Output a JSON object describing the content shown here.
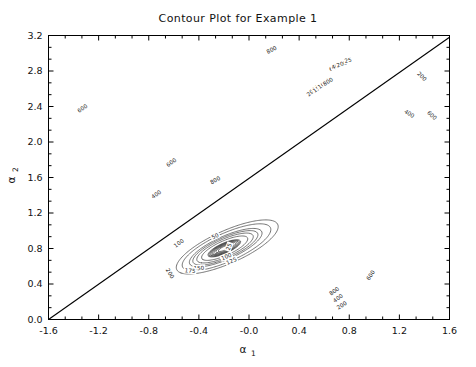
{
  "figure": {
    "title": "Contour Plot for Example 1",
    "background_color": "#ffffff",
    "line_color": "#3a3a3a",
    "axis_color": "#000000"
  },
  "axes": {
    "x": {
      "label_base": "α",
      "label_sub": "1",
      "min": -1.6,
      "max": 1.6,
      "tick_step": 0.4,
      "ticks": [
        -1.6,
        -1.2,
        -0.8,
        -0.4,
        -0.0,
        0.4,
        0.8,
        1.2,
        1.6
      ],
      "tick_labels": [
        "-1.6",
        "-1.2",
        "-0.8",
        "-0.4",
        "-0.0",
        "0.4",
        "0.8",
        "1.2",
        "1.6"
      ],
      "minor_per_major": 2
    },
    "y": {
      "label_base": "α",
      "label_sub": "2",
      "min": 0.0,
      "max": 3.2,
      "tick_step": 0.4,
      "ticks": [
        0.0,
        0.4,
        0.8,
        1.2,
        1.6,
        2.0,
        2.4,
        2.8,
        3.2
      ],
      "tick_labels": [
        "0.0",
        "0.4",
        "0.8",
        "1.2",
        "1.6",
        "2.0",
        "2.4",
        "2.8",
        "3.2"
      ],
      "minor_per_major": 2
    }
  },
  "chart_data": {
    "type": "contour",
    "title": "Contour Plot for Example 1",
    "xlabel": "α₁",
    "ylabel": "α₂",
    "xlim": [
      -1.6,
      1.6
    ],
    "ylim": [
      0.0,
      3.2
    ],
    "grid": false,
    "legend": "none",
    "levels": [
      25,
      50,
      75,
      100,
      125,
      150,
      175,
      200,
      400,
      600,
      800,
      1000,
      1500,
      2000
    ],
    "labeled_levels": [
      25,
      50,
      75,
      100,
      125,
      150,
      175,
      200,
      400,
      600,
      800,
      1000,
      1500,
      2000
    ],
    "minima": [
      {
        "name": "central-basin",
        "x": -0.2,
        "y": 0.8,
        "value": 0
      },
      {
        "name": "upper-right-basin",
        "x": 0.78,
        "y": 2.88,
        "value": 0
      },
      {
        "name": "lower-right-basin",
        "x": 0.9,
        "y": -0.05,
        "value": 0
      }
    ],
    "overlay_line": {
      "name": "diagonal-reference-line",
      "from": [
        -1.6,
        0.0
      ],
      "to": [
        1.6,
        3.18
      ],
      "description": "straight line from lower-left corner to upper-right"
    },
    "contour_labels": [
      {
        "value": "600",
        "x": -1.33,
        "y": 2.38
      },
      {
        "value": "600",
        "x": -0.62,
        "y": 1.77
      },
      {
        "value": "400",
        "x": -0.74,
        "y": 1.41
      },
      {
        "value": "800",
        "x": -0.27,
        "y": 1.57
      },
      {
        "value": "800",
        "x": 0.18,
        "y": 3.04
      },
      {
        "value": "200",
        "x": 1.38,
        "y": 2.74
      },
      {
        "value": "400",
        "x": 1.28,
        "y": 2.32
      },
      {
        "value": "600",
        "x": 1.46,
        "y": 2.3
      },
      {
        "value": "2000",
        "x": 0.51,
        "y": 2.58
      },
      {
        "value": "1500",
        "x": 0.56,
        "y": 2.62
      },
      {
        "value": "1000",
        "x": 0.6,
        "y": 2.66
      },
      {
        "value": "800",
        "x": 0.63,
        "y": 2.68
      },
      {
        "value": "600",
        "x": 0.68,
        "y": 2.84
      },
      {
        "value": "400",
        "x": 0.7,
        "y": 2.86
      },
      {
        "value": "200",
        "x": 0.74,
        "y": 2.88
      },
      {
        "value": "25",
        "x": 0.79,
        "y": 2.92
      },
      {
        "value": "100",
        "x": -0.56,
        "y": 0.86
      },
      {
        "value": "50",
        "x": -0.27,
        "y": 0.94
      },
      {
        "value": "25",
        "x": -0.16,
        "y": 0.82
      },
      {
        "value": "100",
        "x": -0.18,
        "y": 0.71
      },
      {
        "value": "125",
        "x": -0.14,
        "y": 0.66
      },
      {
        "value": "150",
        "x": -0.4,
        "y": 0.58
      },
      {
        "value": "175",
        "x": -0.47,
        "y": 0.55
      },
      {
        "value": "200",
        "x": -0.63,
        "y": 0.52
      },
      {
        "value": "600",
        "x": 0.97,
        "y": 0.5
      },
      {
        "value": "800",
        "x": 0.68,
        "y": 0.32
      },
      {
        "value": "400",
        "x": 0.71,
        "y": 0.24
      },
      {
        "value": "200",
        "x": 0.74,
        "y": 0.16
      }
    ]
  }
}
